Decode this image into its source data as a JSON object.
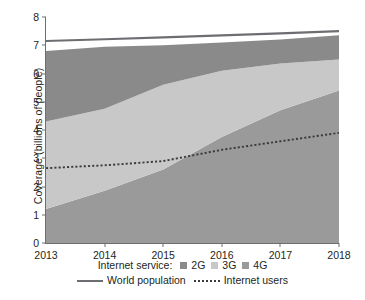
{
  "chart_data": {
    "type": "area",
    "title": "",
    "xlabel": "",
    "ylabel": "Coverage (billions of people)",
    "x": [
      2013,
      2014,
      2015,
      2016,
      2017,
      2018
    ],
    "xticklabels": [
      "2013",
      "2014",
      "2015",
      "2016",
      "2017",
      "2018"
    ],
    "yticklabels": [
      "0",
      "1",
      "2",
      "3",
      "4",
      "5",
      "6",
      "7",
      "8"
    ],
    "xlim": [
      2013,
      2018
    ],
    "ylim": [
      0,
      8
    ],
    "grid": false,
    "stacked": true,
    "legend_position": "bottom",
    "series": [
      {
        "name": "4G",
        "type": "area",
        "color": "#9a9a9a",
        "values": [
          1.2,
          1.85,
          2.6,
          3.75,
          4.7,
          5.4
        ],
        "stack_order": 1
      },
      {
        "name": "3G",
        "type": "area",
        "color": "#c8c8c8",
        "cumulative_values": [
          4.3,
          4.75,
          5.6,
          6.1,
          6.35,
          6.5
        ],
        "values": [
          3.1,
          2.9,
          3.0,
          2.35,
          1.65,
          1.1
        ],
        "stack_order": 2
      },
      {
        "name": "2G",
        "type": "area",
        "color": "#8a8a8a",
        "cumulative_values": [
          6.8,
          6.95,
          7.0,
          7.1,
          7.2,
          7.35
        ],
        "values": [
          2.5,
          2.2,
          1.4,
          1.0,
          0.85,
          0.85
        ],
        "stack_order": 3
      },
      {
        "name": "World population",
        "type": "line",
        "style": "solid",
        "color": "#6d6e71",
        "values": [
          7.15,
          7.21,
          7.28,
          7.35,
          7.42,
          7.5
        ]
      },
      {
        "name": "Internet users",
        "type": "line",
        "style": "dotted",
        "color": "#3b3b3b",
        "values": [
          2.65,
          2.75,
          2.9,
          3.3,
          3.6,
          3.9
        ]
      }
    ]
  },
  "legend": {
    "service_title": "Internet service:",
    "service_items": [
      {
        "label": "2G",
        "color": "#8a8a8a"
      },
      {
        "label": "3G",
        "color": "#c8c8c8"
      },
      {
        "label": "4G",
        "color": "#9a9a9a"
      }
    ],
    "line_items": [
      {
        "label": "World population",
        "style": "solid"
      },
      {
        "label": "Internet users",
        "style": "dotted"
      }
    ]
  }
}
